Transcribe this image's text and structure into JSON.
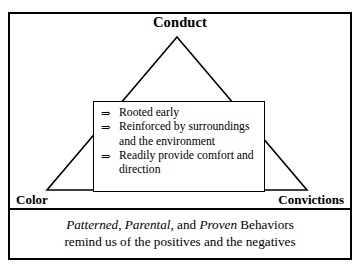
{
  "diagram": {
    "apex": {
      "label": "Conduct"
    },
    "base_left": {
      "label": "Color"
    },
    "base_right": {
      "label": "Convictions"
    },
    "callout": {
      "bullet_glyph": "⇒",
      "items": [
        "Rooted early",
        "Reinforced by surroundings and the environment",
        "Readily provide comfort and direction"
      ]
    },
    "caption": {
      "line1": {
        "word1_italic": "Patterned",
        "sep1": ", ",
        "word2_italic": "Parental",
        "sep2": ", and ",
        "word3_italic": "Proven",
        "tail": " Behaviors"
      },
      "line2": "remind us of the positives and the negatives"
    },
    "colors": {
      "stroke": "#000000",
      "background": "#ffffff"
    }
  }
}
